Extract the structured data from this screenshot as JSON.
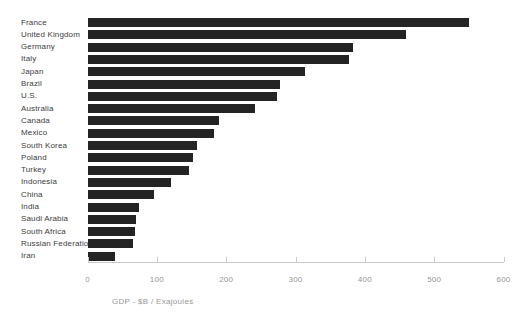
{
  "figure": {
    "background": "#ffffff",
    "bar_color": "#242424",
    "category_label_color": "#3d3d3d",
    "tick_label_color": "#979797",
    "axis_line_color": "#c9c9c9"
  },
  "chart_data": {
    "type": "bar",
    "orientation": "horizontal",
    "title": "",
    "xlabel": "GDP - $B / Exajoules",
    "ylabel": "",
    "xlim": [
      0,
      600
    ],
    "x_ticks": [
      0,
      100,
      200,
      300,
      400,
      500,
      600
    ],
    "grid": false,
    "legend": false,
    "categories": [
      "France",
      "United Kingdom",
      "Germany",
      "Italy",
      "Japan",
      "Brazil",
      "U.S.",
      "Australia",
      "Canada",
      "Mexico",
      "South Korea",
      "Poland",
      "Turkey",
      "Indonesia",
      "China",
      "India",
      "Saudi Arabia",
      "South Africa",
      "Russian Federation",
      "Iran"
    ],
    "values": [
      550,
      460,
      383,
      377,
      314,
      278,
      274,
      242,
      189,
      182,
      158,
      152,
      147,
      121,
      96,
      74,
      70,
      69,
      66,
      39
    ]
  }
}
